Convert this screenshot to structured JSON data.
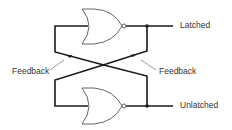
{
  "diagram": {
    "type": "NOR-gate latch (cross-coupled)",
    "gates": [
      {
        "name": "top-nor-gate",
        "kind": "NOR"
      },
      {
        "name": "bottom-nor-gate",
        "kind": "NOR"
      }
    ],
    "labels": {
      "latched": "Latched",
      "unlatched": "Unlatched",
      "feedback_left": "Feedback",
      "feedback_right": "Feedback"
    },
    "colors": {
      "wire": "#1a1a1a",
      "gate_outline": "#555555",
      "text": "#333333",
      "background": "#ffffff"
    }
  }
}
